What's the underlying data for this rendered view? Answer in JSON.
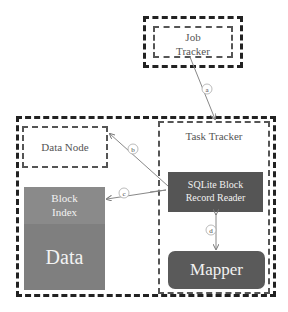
{
  "job_tracker": {
    "line1": "Job",
    "line2": "Tracker"
  },
  "data_node": {
    "label": "Data Node"
  },
  "task_tracker": {
    "label": "Task Tracker"
  },
  "block_index": {
    "line1": "Block",
    "line2": "Index"
  },
  "data_block": {
    "label": "Data"
  },
  "sqlite_reader": {
    "line1": "SQLite Block",
    "line2": "Record Reader"
  },
  "mapper": {
    "label": "Mapper"
  },
  "edges": [
    {
      "id": "a",
      "from": "job_tracker",
      "to": "task_tracker"
    },
    {
      "id": "b",
      "from": "sqlite_reader",
      "to": "data_node"
    },
    {
      "id": "c",
      "from": "sqlite_reader",
      "to": "block_index"
    },
    {
      "id": "d",
      "from": "sqlite_reader",
      "to": "mapper"
    }
  ],
  "colors": {
    "block_index": "#8a8a8a",
    "data": "#7f7f7f",
    "sqlite": "#555555",
    "mapper": "#5a5a5a"
  }
}
